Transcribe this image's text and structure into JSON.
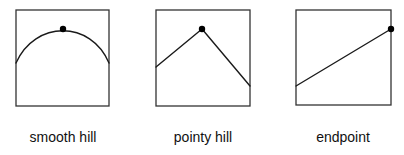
{
  "figure": {
    "panels": [
      {
        "id": "smooth-hill",
        "label": "smooth hill",
        "frame": {
          "x": 16,
          "y": 10,
          "w": 93,
          "h": 96
        },
        "curve_type": "smooth",
        "curve": "M16,63 C35,20 91,20 109,63",
        "marker": {
          "x": 63,
          "y": 29,
          "r": 3.2
        },
        "label_center_x": 63
      },
      {
        "id": "pointy-hill",
        "label": "pointy hill",
        "frame": {
          "x": 156,
          "y": 10,
          "w": 94,
          "h": 96
        },
        "curve_type": "piecewise-linear",
        "curve": "M156,67 L202,29 L250,86",
        "marker": {
          "x": 202,
          "y": 29,
          "r": 3.2
        },
        "label_center_x": 203
      },
      {
        "id": "endpoint",
        "label": "endpoint",
        "frame": {
          "x": 296,
          "y": 10,
          "w": 95,
          "h": 95
        },
        "curve_type": "linear",
        "curve": "M296,86 L391,29",
        "marker": {
          "x": 391,
          "y": 29,
          "r": 3.2
        },
        "label_center_x": 343
      }
    ]
  }
}
